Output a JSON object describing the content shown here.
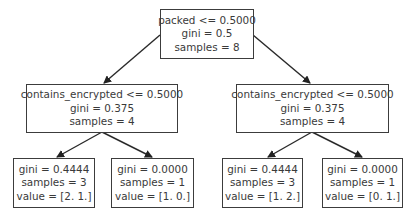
{
  "diagram": {
    "type": "decision-tree",
    "nodes": {
      "root": {
        "condition": "packed <= 0.5000",
        "gini": "gini = 0.5",
        "samples": "samples = 8"
      },
      "left": {
        "condition": "contains_encrypted <= 0.5000",
        "gini": "gini = 0.375",
        "samples": "samples = 4"
      },
      "right": {
        "condition": "contains_encrypted <= 0.5000",
        "gini": "gini = 0.375",
        "samples": "samples = 4"
      },
      "leaf_ll": {
        "gini": "gini = 0.4444",
        "samples": "samples = 3",
        "value": "value = [2. 1.]"
      },
      "leaf_lr": {
        "gini": "gini = 0.0000",
        "samples": "samples = 1",
        "value": "value = [1. 0.]"
      },
      "leaf_rl": {
        "gini": "gini = 0.4444",
        "samples": "samples = 3",
        "value": "value = [1. 2.]"
      },
      "leaf_rr": {
        "gini": "gini = 0.0000",
        "samples": "samples = 1",
        "value": "value = [0. 1.]"
      }
    },
    "edges": [
      [
        "root",
        "left"
      ],
      [
        "root",
        "right"
      ],
      [
        "left",
        "leaf_ll"
      ],
      [
        "left",
        "leaf_lr"
      ],
      [
        "right",
        "leaf_rl"
      ],
      [
        "right",
        "leaf_rr"
      ]
    ],
    "colors": {
      "stroke": "#3c3c3c",
      "text": "#3a3a3a",
      "background": "#ffffff"
    }
  }
}
